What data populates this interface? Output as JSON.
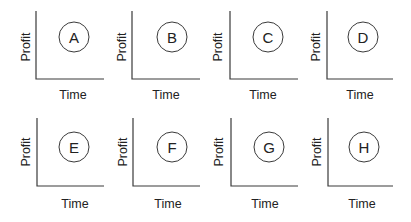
{
  "figure": {
    "panels": [
      {
        "letter": "A",
        "xlabel": "Time",
        "ylabel": "Profit"
      },
      {
        "letter": "B",
        "xlabel": "Time",
        "ylabel": "Profit"
      },
      {
        "letter": "C",
        "xlabel": "Time",
        "ylabel": "Profit"
      },
      {
        "letter": "D",
        "xlabel": "Time",
        "ylabel": "Profit"
      },
      {
        "letter": "E",
        "xlabel": "Time",
        "ylabel": "Profit"
      },
      {
        "letter": "F",
        "xlabel": "Time",
        "ylabel": "Profit"
      },
      {
        "letter": "G",
        "xlabel": "Time",
        "ylabel": "Profit"
      },
      {
        "letter": "H",
        "xlabel": "Time",
        "ylabel": "Profit"
      }
    ],
    "colors": {
      "line": "#3a3a3a",
      "text": "#222222",
      "background": "#ffffff"
    }
  }
}
